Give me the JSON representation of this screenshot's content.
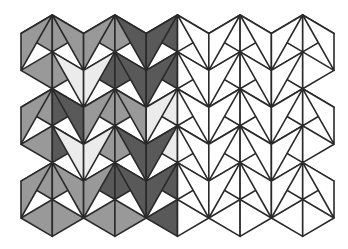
{
  "grid": {
    "origin_x": 21,
    "column_spacing": 31.3,
    "odd_column_first_y": 15,
    "even_column_first_y": 33.5,
    "row_step": 36.9,
    "strips": 10,
    "triangles_per_strip": 11
  },
  "palette": {
    "M": "#999999",
    "D": "#595959",
    "W": "#ebebeb",
    "0": "#ffffff"
  },
  "stroke": {
    "color": "#2a2a2a",
    "width": 1.6
  },
  "shading": [
    [
      "M",
      "M",
      "M",
      "X",
      "M",
      "M",
      "M",
      "X",
      "M",
      "M",
      "M"
    ],
    [
      "M",
      "M",
      "M",
      "W",
      "D",
      "D",
      "D",
      "W",
      "M",
      "M",
      "M"
    ],
    [
      "M",
      "M",
      "D",
      "W",
      "M",
      "M",
      "M",
      "W",
      "D",
      "M",
      "M"
    ],
    [
      "M",
      "D",
      "D",
      "D",
      "M",
      "M",
      "M",
      "D",
      "D",
      "D",
      "M"
    ],
    [
      "D",
      "D",
      "D",
      "D",
      "W",
      "W",
      "W",
      "D",
      "D",
      "D",
      "D"
    ],
    [
      "0",
      "0",
      "0",
      "0",
      "0",
      "0",
      "0",
      "0",
      "0",
      "0",
      "0"
    ],
    [
      "0",
      "0",
      "0",
      "0",
      "0",
      "0",
      "0",
      "0",
      "0",
      "0",
      "0"
    ],
    [
      "0",
      "0",
      "0",
      "0",
      "0",
      "0",
      "0",
      "0",
      "0",
      "0",
      "0"
    ],
    [
      "0",
      "0",
      "0",
      "0",
      "0",
      "0",
      "0",
      "0",
      "0",
      "0",
      "0"
    ],
    [
      "0",
      "0",
      "0",
      "X",
      "0",
      "0",
      "0",
      "X",
      "0",
      "0",
      "0"
    ]
  ]
}
